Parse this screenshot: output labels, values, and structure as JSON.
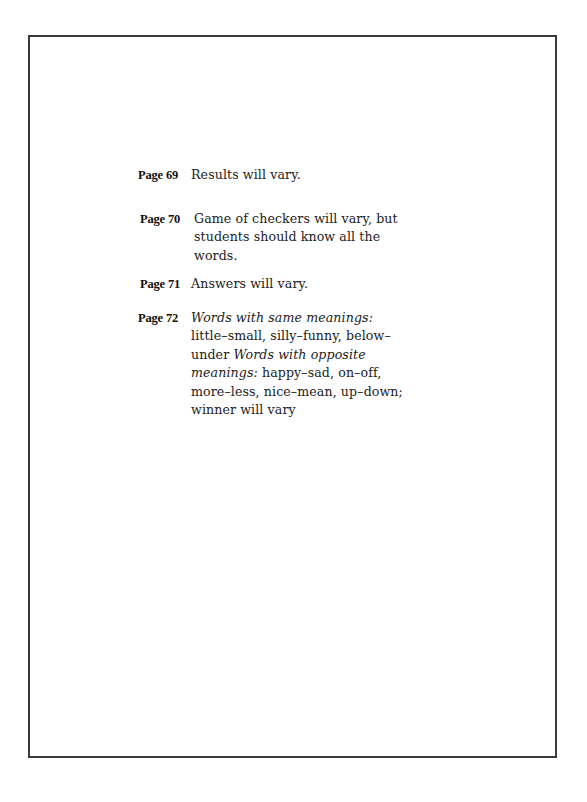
{
  "document": {
    "entries": [
      {
        "label": "Page 69",
        "text": "Results will vary."
      },
      {
        "label": "Page 70",
        "text": "Game of checkers will vary, but students should know all the words."
      },
      {
        "label": "Page 71",
        "text": "Answers will vary."
      },
      {
        "label": "Page 72",
        "segments": [
          {
            "italic": true,
            "text": "Words with same meanings:"
          },
          {
            "italic": false,
            "text": " little–small, silly–funny, below–under "
          },
          {
            "italic": true,
            "text": "Words with opposite meanings:"
          },
          {
            "italic": false,
            "text": " happy–sad, on–off, more–less, nice–mean, up–down; winner will vary"
          }
        ]
      }
    ]
  }
}
